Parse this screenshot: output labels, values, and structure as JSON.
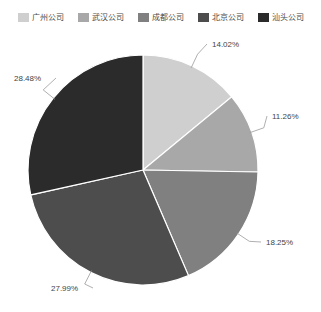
{
  "chart_data": {
    "type": "pie",
    "title": "",
    "legend_position": "top",
    "categories": [
      "广州公司",
      "武汉公司",
      "成都公司",
      "北京公司",
      "汕头公司"
    ],
    "values": [
      14.02,
      11.26,
      18.25,
      27.99,
      28.48
    ],
    "value_labels": [
      "14.02%",
      "11.26%",
      "18.25%",
      "27.99%",
      "28.48%"
    ],
    "colors": [
      "#cfcfcf",
      "#a8a8a8",
      "#808080",
      "#4d4d4d",
      "#2b2b2b"
    ],
    "start_angle_deg": 0,
    "direction": "clockwise",
    "xlabel": "",
    "ylabel": "",
    "grid": false
  },
  "legend": {
    "items": [
      {
        "label": "广州公司",
        "color": "#cfcfcf"
      },
      {
        "label": "武汉公司",
        "color": "#a8a8a8"
      },
      {
        "label": "成都公司",
        "color": "#808080"
      },
      {
        "label": "北京公司",
        "color": "#4d4d4d"
      },
      {
        "label": "汕头公司",
        "color": "#2b2b2b"
      }
    ]
  },
  "labels": {
    "slice0": "14.02%",
    "slice1": "11.26%",
    "slice2": "18.25%",
    "slice3": "27.99%",
    "slice4": "28.48%"
  }
}
